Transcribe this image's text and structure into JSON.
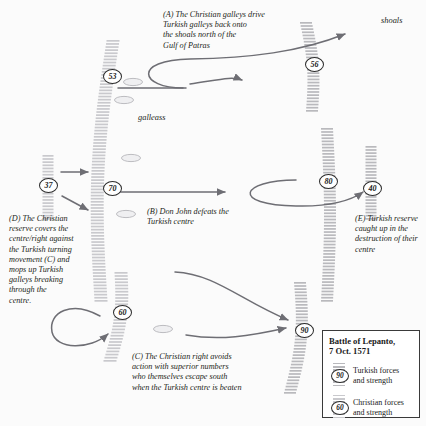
{
  "background": "#fbfbfb",
  "colors": {
    "ink": "#231f20",
    "arrow": "#6e6e74",
    "turkish_line": "#b9b9bd",
    "christian_line": "#c9c9cd",
    "marker_ring": "#2b2b2b"
  },
  "labels": {
    "shoals": "shoals",
    "galleass": "galleass"
  },
  "notes": {
    "a": "(A) The Christian galleys drive\nTurkish galleys back onto\nthe shoals north of the\nGulf of Patras",
    "b": "(B) Don John defeats the\nTurkish centre",
    "c": "(C) The Christian right avoids\naction with superior numbers\nwho themselves escape south\nwhen the Turkish centre is beaten",
    "d": "(D) The Christian\nreserve covers the\ncentre/right against\nthe Turkish turning\nmovement (C) and\nmops up Turkish\ngalleys breaking\nthrough the\ncentre.",
    "e": "(E) Turkish reserve\ncaught up in the\ndestruction of their\ncentre"
  },
  "markers": [
    {
      "id": "m53",
      "value": "53",
      "side": "christian",
      "x": 103,
      "y": 69
    },
    {
      "id": "m56",
      "value": "56",
      "side": "turkish",
      "x": 305,
      "y": 57
    },
    {
      "id": "m37",
      "value": "37",
      "side": "christian",
      "x": 39,
      "y": 178
    },
    {
      "id": "m70",
      "value": "70",
      "side": "christian",
      "x": 103,
      "y": 181
    },
    {
      "id": "m80",
      "value": "80",
      "side": "turkish",
      "x": 319,
      "y": 174
    },
    {
      "id": "m40",
      "value": "40",
      "side": "turkish",
      "x": 363,
      "y": 181
    },
    {
      "id": "m60",
      "value": "60",
      "side": "christian",
      "x": 113,
      "y": 305
    },
    {
      "id": "m90",
      "value": "90",
      "side": "turkish",
      "x": 295,
      "y": 323
    }
  ],
  "legend": {
    "title": "Battle of Lepanto,\n7 Oct. 1571",
    "rows": [
      {
        "symbol": "90",
        "text": "Turkish forces\nand strength"
      },
      {
        "symbol": "60",
        "text": "Christian forces\nand strength"
      }
    ]
  },
  "galleass_ovals": [
    {
      "x": 133,
      "y": 82
    },
    {
      "x": 124,
      "y": 100
    },
    {
      "x": 131,
      "y": 158
    },
    {
      "x": 126,
      "y": 214
    },
    {
      "x": 163,
      "y": 329
    }
  ]
}
